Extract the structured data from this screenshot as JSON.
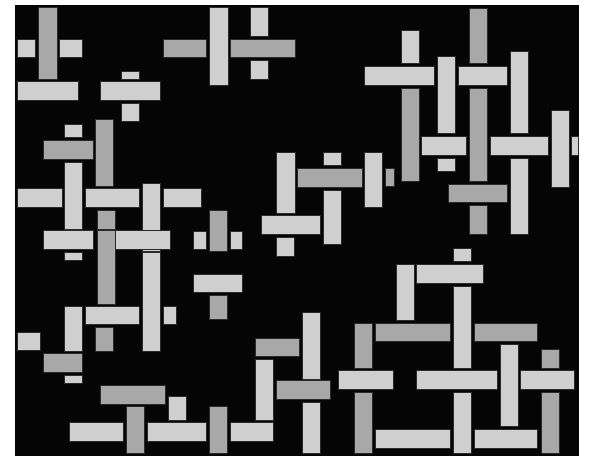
{
  "image": {
    "description": "Abstract composition of overlapping light and dark gray rectangles on a black background",
    "background": "#050505",
    "frame": "#ffffff",
    "colors": {
      "light": "#cfcfcf",
      "dark": "#a8a8a8"
    }
  },
  "rects": [
    {
      "x": 38,
      "y": 7,
      "w": 20,
      "h": 73,
      "t": "D"
    },
    {
      "x": 17,
      "y": 39,
      "w": 19,
      "h": 19,
      "t": "L"
    },
    {
      "x": 59,
      "y": 39,
      "w": 24,
      "h": 19,
      "t": "L"
    },
    {
      "x": 17,
      "y": 81,
      "w": 62,
      "h": 20,
      "t": "L"
    },
    {
      "x": 121,
      "y": 71,
      "w": 19,
      "h": 9,
      "t": "L"
    },
    {
      "x": 100,
      "y": 81,
      "w": 61,
      "h": 20,
      "t": "L"
    },
    {
      "x": 121,
      "y": 103,
      "w": 19,
      "h": 19,
      "t": "L"
    },
    {
      "x": 163,
      "y": 39,
      "w": 44,
      "h": 19,
      "t": "D"
    },
    {
      "x": 209,
      "y": 7,
      "w": 20,
      "h": 79,
      "t": "L"
    },
    {
      "x": 230,
      "y": 39,
      "w": 66,
      "h": 19,
      "t": "D"
    },
    {
      "x": 250,
      "y": 7,
      "w": 19,
      "h": 30,
      "t": "L"
    },
    {
      "x": 250,
      "y": 60,
      "w": 19,
      "h": 20,
      "t": "L"
    },
    {
      "x": 64,
      "y": 124,
      "w": 19,
      "h": 14,
      "t": "L"
    },
    {
      "x": 43,
      "y": 140,
      "w": 51,
      "h": 20,
      "t": "D"
    },
    {
      "x": 95,
      "y": 119,
      "w": 19,
      "h": 68,
      "t": "D"
    },
    {
      "x": 64,
      "y": 162,
      "w": 19,
      "h": 68,
      "t": "L"
    },
    {
      "x": 17,
      "y": 188,
      "w": 46,
      "h": 20,
      "t": "L"
    },
    {
      "x": 85,
      "y": 188,
      "w": 55,
      "h": 20,
      "t": "L"
    },
    {
      "x": 142,
      "y": 183,
      "w": 19,
      "h": 69,
      "t": "L"
    },
    {
      "x": 163,
      "y": 188,
      "w": 39,
      "h": 20,
      "t": "L"
    },
    {
      "x": 97,
      "y": 210,
      "w": 19,
      "h": 20,
      "t": "D"
    },
    {
      "x": 43,
      "y": 230,
      "w": 51,
      "h": 20,
      "t": "L"
    },
    {
      "x": 64,
      "y": 252,
      "w": 19,
      "h": 9,
      "t": "L"
    },
    {
      "x": 97,
      "y": 230,
      "w": 19,
      "h": 75,
      "t": "D"
    },
    {
      "x": 115,
      "y": 230,
      "w": 56,
      "h": 20,
      "t": "L"
    },
    {
      "x": 142,
      "y": 252,
      "w": 19,
      "h": 100,
      "t": "L"
    },
    {
      "x": 193,
      "y": 231,
      "w": 14,
      "h": 19,
      "t": "L"
    },
    {
      "x": 209,
      "y": 210,
      "w": 19,
      "h": 42,
      "t": "D"
    },
    {
      "x": 230,
      "y": 231,
      "w": 13,
      "h": 19,
      "t": "L"
    },
    {
      "x": 193,
      "y": 274,
      "w": 50,
      "h": 19,
      "t": "L"
    },
    {
      "x": 209,
      "y": 295,
      "w": 19,
      "h": 25,
      "t": "D"
    },
    {
      "x": 276,
      "y": 152,
      "w": 20,
      "h": 62,
      "t": "L"
    },
    {
      "x": 297,
      "y": 168,
      "w": 66,
      "h": 20,
      "t": "D"
    },
    {
      "x": 323,
      "y": 152,
      "w": 19,
      "h": 14,
      "t": "L"
    },
    {
      "x": 323,
      "y": 190,
      "w": 19,
      "h": 55,
      "t": "L"
    },
    {
      "x": 364,
      "y": 152,
      "w": 19,
      "h": 56,
      "t": "L"
    },
    {
      "x": 385,
      "y": 168,
      "w": 10,
      "h": 19,
      "t": "D"
    },
    {
      "x": 261,
      "y": 215,
      "w": 60,
      "h": 20,
      "t": "L"
    },
    {
      "x": 276,
      "y": 237,
      "w": 19,
      "h": 20,
      "t": "L"
    },
    {
      "x": 401,
      "y": 30,
      "w": 19,
      "h": 34,
      "t": "L"
    },
    {
      "x": 364,
      "y": 66,
      "w": 71,
      "h": 20,
      "t": "L"
    },
    {
      "x": 401,
      "y": 88,
      "w": 19,
      "h": 94,
      "t": "D"
    },
    {
      "x": 437,
      "y": 56,
      "w": 19,
      "h": 78,
      "t": "L"
    },
    {
      "x": 469,
      "y": 8,
      "w": 19,
      "h": 56,
      "t": "D"
    },
    {
      "x": 458,
      "y": 66,
      "w": 50,
      "h": 20,
      "t": "L"
    },
    {
      "x": 469,
      "y": 88,
      "w": 19,
      "h": 94,
      "t": "D"
    },
    {
      "x": 510,
      "y": 51,
      "w": 19,
      "h": 83,
      "t": "L"
    },
    {
      "x": 421,
      "y": 136,
      "w": 46,
      "h": 20,
      "t": "L"
    },
    {
      "x": 437,
      "y": 158,
      "w": 19,
      "h": 14,
      "t": "L"
    },
    {
      "x": 490,
      "y": 136,
      "w": 59,
      "h": 20,
      "t": "L"
    },
    {
      "x": 551,
      "y": 110,
      "w": 19,
      "h": 78,
      "t": "L"
    },
    {
      "x": 571,
      "y": 136,
      "w": 8,
      "h": 20,
      "t": "L"
    },
    {
      "x": 448,
      "y": 184,
      "w": 60,
      "h": 19,
      "t": "D"
    },
    {
      "x": 469,
      "y": 205,
      "w": 19,
      "h": 30,
      "t": "D"
    },
    {
      "x": 510,
      "y": 158,
      "w": 19,
      "h": 77,
      "t": "L"
    },
    {
      "x": 453,
      "y": 248,
      "w": 19,
      "h": 14,
      "t": "L"
    },
    {
      "x": 396,
      "y": 264,
      "w": 19,
      "h": 57,
      "t": "L"
    },
    {
      "x": 416,
      "y": 264,
      "w": 68,
      "h": 20,
      "t": "L"
    },
    {
      "x": 453,
      "y": 286,
      "w": 19,
      "h": 83,
      "t": "L"
    },
    {
      "x": 354,
      "y": 323,
      "w": 19,
      "h": 46,
      "t": "D"
    },
    {
      "x": 375,
      "y": 323,
      "w": 76,
      "h": 19,
      "t": "D"
    },
    {
      "x": 474,
      "y": 323,
      "w": 64,
      "h": 19,
      "t": "D"
    },
    {
      "x": 500,
      "y": 344,
      "w": 19,
      "h": 83,
      "t": "L"
    },
    {
      "x": 541,
      "y": 349,
      "w": 19,
      "h": 20,
      "t": "D"
    },
    {
      "x": 338,
      "y": 370,
      "w": 56,
      "h": 20,
      "t": "L"
    },
    {
      "x": 416,
      "y": 370,
      "w": 82,
      "h": 20,
      "t": "L"
    },
    {
      "x": 520,
      "y": 370,
      "w": 55,
      "h": 20,
      "t": "L"
    },
    {
      "x": 354,
      "y": 392,
      "w": 19,
      "h": 62,
      "t": "D"
    },
    {
      "x": 453,
      "y": 392,
      "w": 19,
      "h": 62,
      "t": "L"
    },
    {
      "x": 541,
      "y": 392,
      "w": 19,
      "h": 62,
      "t": "D"
    },
    {
      "x": 375,
      "y": 429,
      "w": 76,
      "h": 20,
      "t": "L"
    },
    {
      "x": 474,
      "y": 429,
      "w": 64,
      "h": 20,
      "t": "L"
    },
    {
      "x": 302,
      "y": 312,
      "w": 19,
      "h": 68,
      "t": "L"
    },
    {
      "x": 255,
      "y": 338,
      "w": 45,
      "h": 19,
      "t": "D"
    },
    {
      "x": 255,
      "y": 359,
      "w": 19,
      "h": 62,
      "t": "L"
    },
    {
      "x": 276,
      "y": 380,
      "w": 55,
      "h": 20,
      "t": "D"
    },
    {
      "x": 302,
      "y": 402,
      "w": 19,
      "h": 52,
      "t": "L"
    },
    {
      "x": 17,
      "y": 332,
      "w": 24,
      "h": 19,
      "t": "L"
    },
    {
      "x": 64,
      "y": 306,
      "w": 19,
      "h": 46,
      "t": "L"
    },
    {
      "x": 85,
      "y": 306,
      "w": 55,
      "h": 19,
      "t": "L"
    },
    {
      "x": 95,
      "y": 327,
      "w": 19,
      "h": 25,
      "t": "D"
    },
    {
      "x": 163,
      "y": 306,
      "w": 14,
      "h": 19,
      "t": "L"
    },
    {
      "x": 43,
      "y": 353,
      "w": 40,
      "h": 20,
      "t": "D"
    },
    {
      "x": 64,
      "y": 375,
      "w": 19,
      "h": 9,
      "t": "L"
    },
    {
      "x": 100,
      "y": 385,
      "w": 66,
      "h": 20,
      "t": "D"
    },
    {
      "x": 168,
      "y": 396,
      "w": 19,
      "h": 25,
      "t": "L"
    },
    {
      "x": 69,
      "y": 422,
      "w": 55,
      "h": 20,
      "t": "L"
    },
    {
      "x": 126,
      "y": 406,
      "w": 19,
      "h": 48,
      "t": "D"
    },
    {
      "x": 147,
      "y": 422,
      "w": 60,
      "h": 20,
      "t": "L"
    },
    {
      "x": 209,
      "y": 406,
      "w": 19,
      "h": 48,
      "t": "D"
    },
    {
      "x": 230,
      "y": 422,
      "w": 44,
      "h": 20,
      "t": "L"
    }
  ]
}
